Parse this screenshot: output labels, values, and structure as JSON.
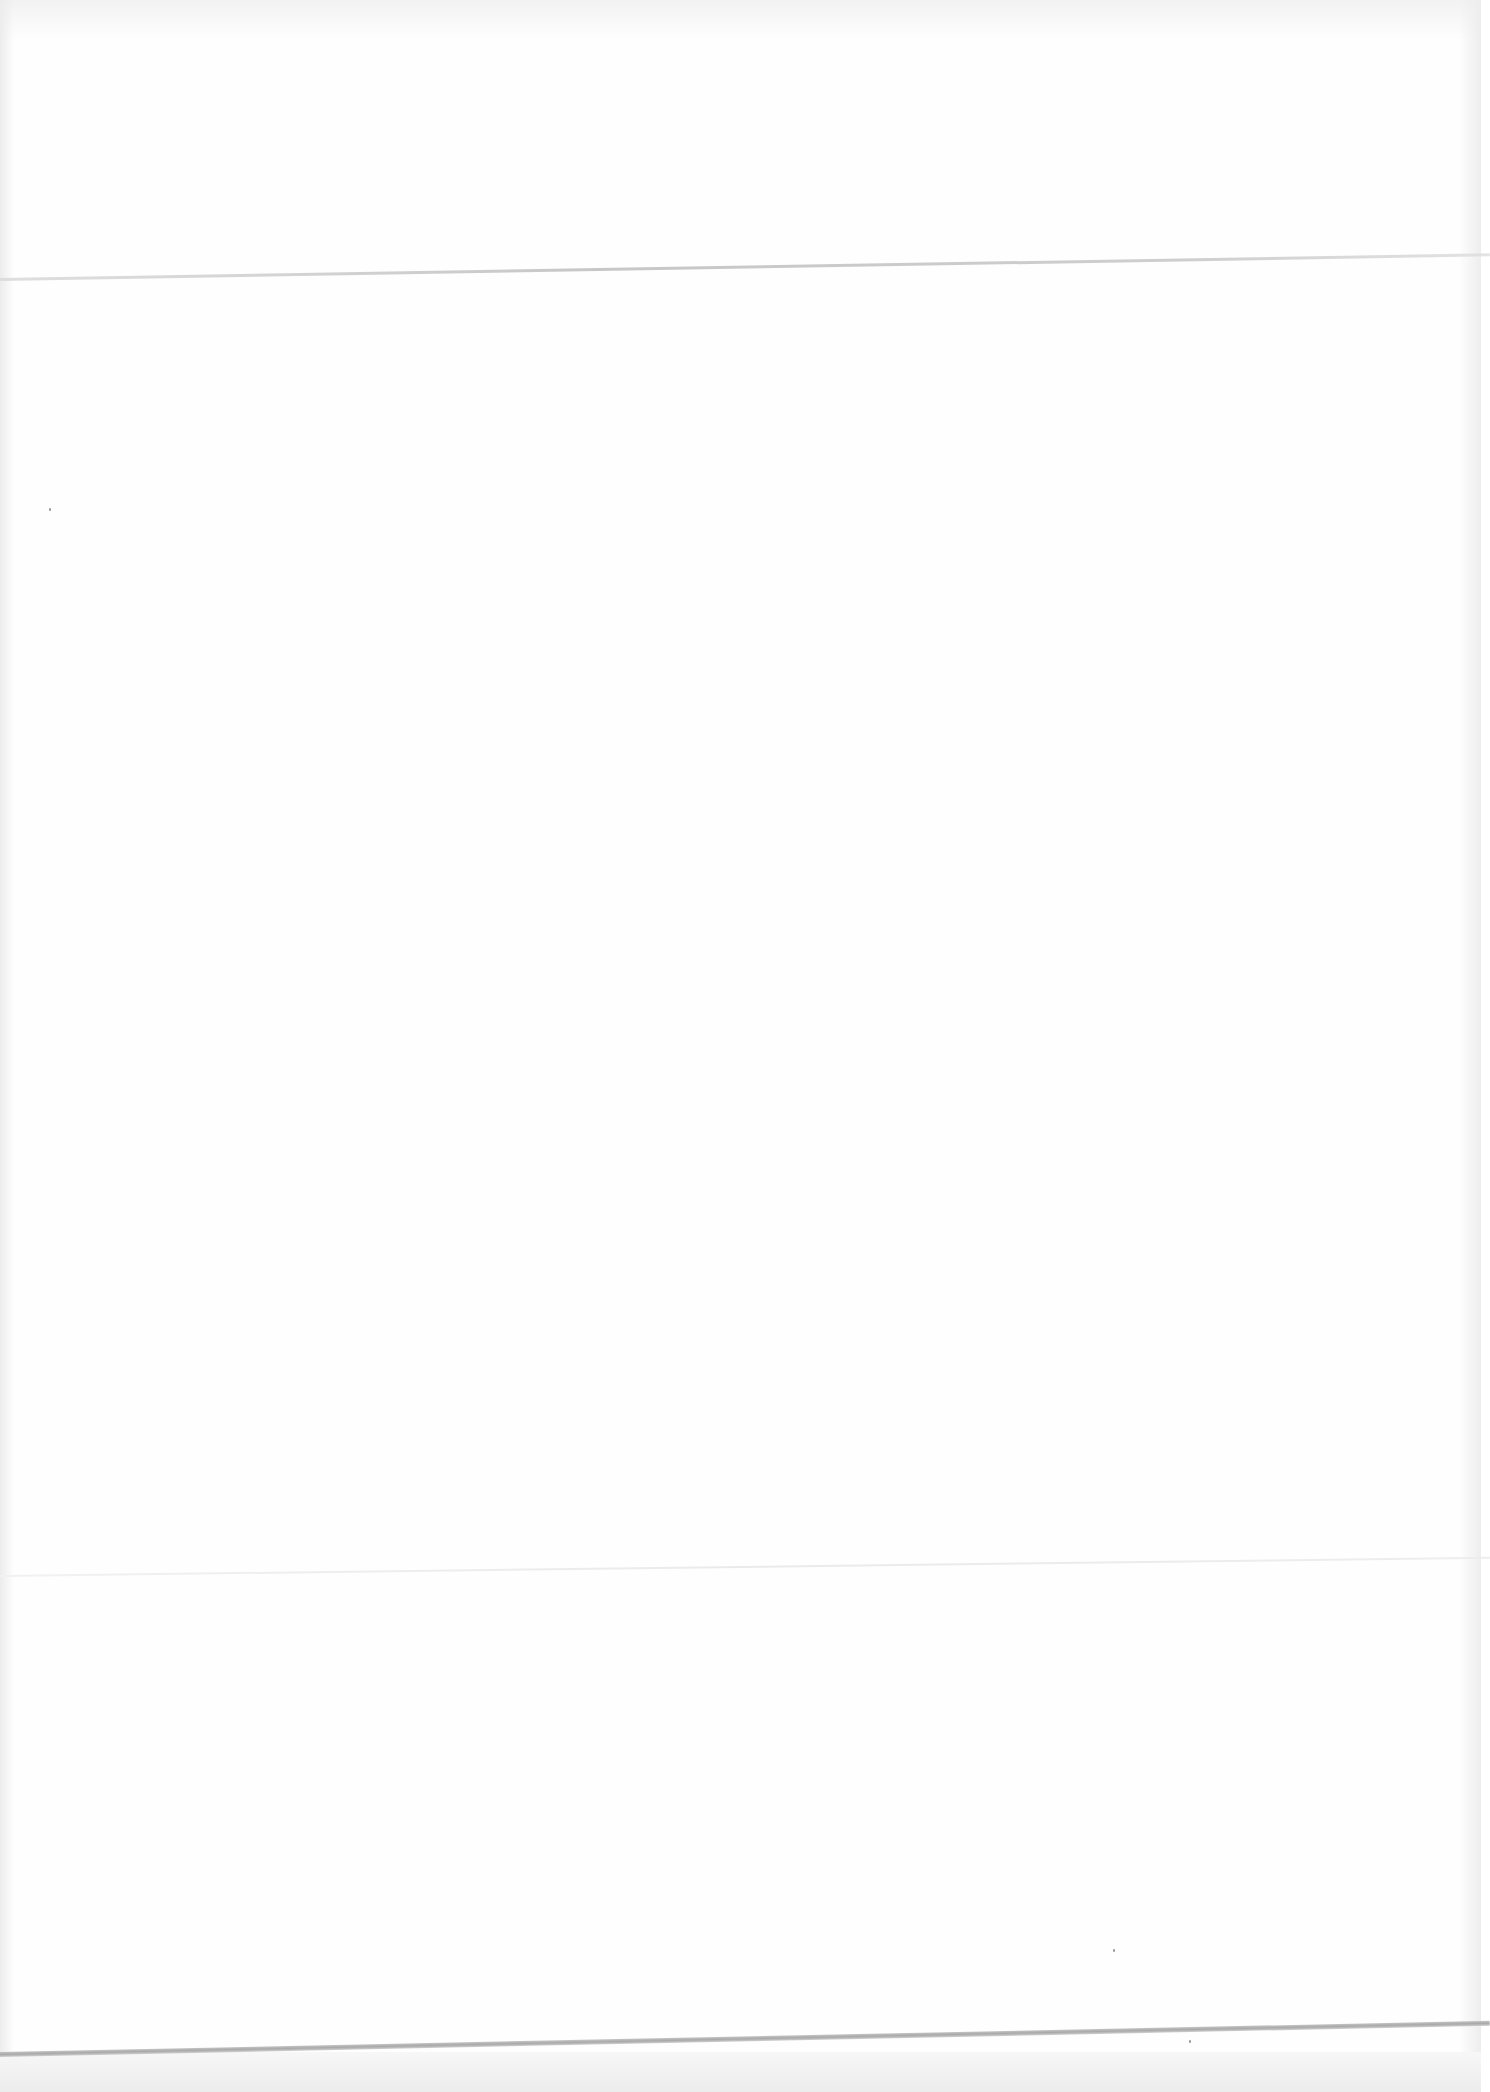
{
  "document": {
    "type": "scanned-page",
    "text_content": [],
    "fold_lines": 3
  },
  "colors": {
    "paper": "#fefefe",
    "fold_crease": "#a9a9a9",
    "scanner_edge": "#ececec"
  }
}
